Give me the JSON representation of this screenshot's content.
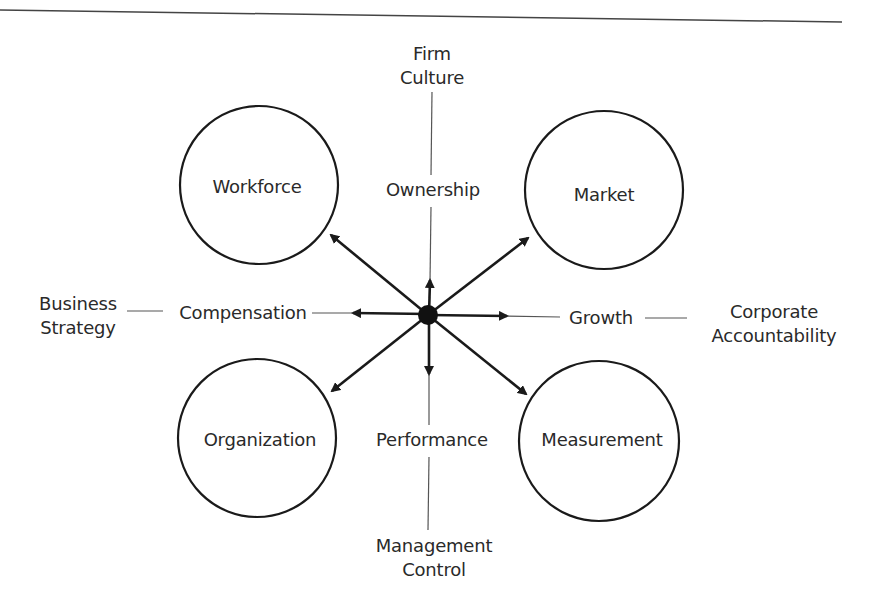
{
  "diagram": {
    "type": "radial-framework",
    "center_hub": {
      "label": "",
      "x": 428,
      "y": 315
    },
    "circles": [
      {
        "id": "workforce",
        "label": "Workforce",
        "cx": 259,
        "cy": 185,
        "r": 79
      },
      {
        "id": "market",
        "label": "Market",
        "cx": 604,
        "cy": 190,
        "r": 79
      },
      {
        "id": "organization",
        "label": "Organization",
        "cx": 257,
        "cy": 438,
        "r": 79
      },
      {
        "id": "measurement",
        "label": "Measurement",
        "cx": 599,
        "cy": 441,
        "r": 80
      }
    ],
    "axis_labels": {
      "up": "Ownership",
      "down": "Performance",
      "left": "Compensation",
      "right": "Growth"
    },
    "outer_labels": {
      "top": [
        "Firm",
        "Culture"
      ],
      "bottom": [
        "Management",
        "Control"
      ],
      "left": [
        "Business",
        "Strategy"
      ],
      "right": [
        "Corporate",
        "Accountability"
      ]
    },
    "arrows": [
      {
        "dir": "up",
        "to": "Ownership"
      },
      {
        "dir": "down",
        "to": "Performance"
      },
      {
        "dir": "left",
        "to": "Compensation"
      },
      {
        "dir": "right",
        "to": "Growth"
      },
      {
        "dir": "up-left",
        "to": "Workforce"
      },
      {
        "dir": "up-right",
        "to": "Market"
      },
      {
        "dir": "down-left",
        "to": "Organization"
      },
      {
        "dir": "down-right",
        "to": "Measurement"
      }
    ],
    "colors": {
      "stroke": "#1a1a1a",
      "text": "#2a2a2a",
      "thin_line": "#555555"
    }
  }
}
